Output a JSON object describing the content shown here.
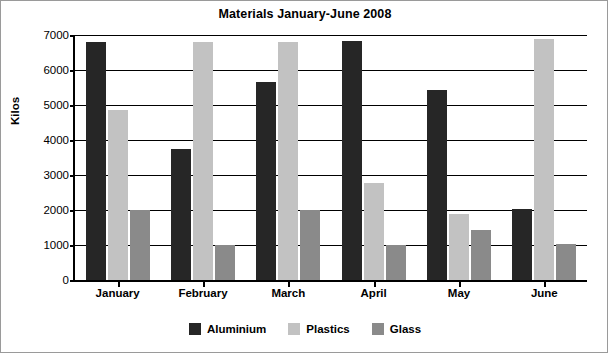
{
  "chart_data": {
    "type": "bar",
    "title": "Materials January-June 2008",
    "xlabel": "",
    "ylabel": "Kilos",
    "categories": [
      "January",
      "February",
      "March",
      "April",
      "May",
      "June"
    ],
    "series": [
      {
        "name": "Aluminium",
        "color": "#262626",
        "values": [
          6800,
          3750,
          5650,
          6820,
          5430,
          2020
        ]
      },
      {
        "name": "Plastics",
        "color": "#c2c2c2",
        "values": [
          4850,
          6800,
          6800,
          2780,
          1880,
          6900
        ]
      },
      {
        "name": "Glass",
        "color": "#8a8a8a",
        "values": [
          2000,
          990,
          2010,
          990,
          1440,
          1030
        ]
      }
    ],
    "ylim": [
      0,
      7000
    ],
    "yticks": [
      0,
      1000,
      2000,
      3000,
      4000,
      5000,
      6000,
      7000
    ],
    "ytick_labels": [
      "0",
      "1000",
      "2000",
      "3000",
      "4000",
      "5000",
      "6000",
      "7000"
    ],
    "grid": "horizontal",
    "legend_position": "bottom"
  }
}
